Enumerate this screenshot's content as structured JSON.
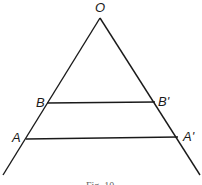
{
  "figure": {
    "labels": {
      "apex": "O",
      "upper_left": "B",
      "upper_right": "B'",
      "lower_left": "A",
      "lower_right": "A'"
    },
    "caption": "Fig. 10",
    "stroke_color": "#1a1a1a",
    "geometry": {
      "apex": [
        100,
        18
      ],
      "left_end": [
        3,
        175
      ],
      "right_end": [
        200,
        175
      ],
      "segment_BB": {
        "from": [
          47,
          103
        ],
        "to": [
          155,
          102
        ]
      },
      "segment_AA": {
        "from": [
          26,
          139
        ],
        "to": [
          178,
          137
        ]
      }
    }
  }
}
